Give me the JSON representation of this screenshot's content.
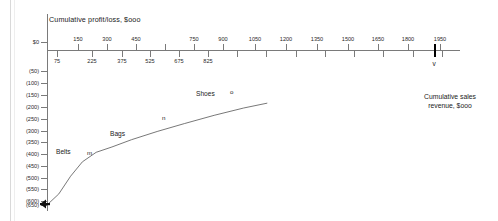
{
  "chart_data": {
    "type": "line",
    "title": "Cumulative profit/loss, $ooo",
    "xlabel": "Cumulative sales revenue, $ooo",
    "ylabel": "Cumulative profit/loss, $ooo",
    "grid": false,
    "legend": "none",
    "xlim": [
      0,
      2100
    ],
    "ylim": [
      -650,
      50
    ],
    "x_ticks_upper": [
      150,
      300,
      450,
      600,
      750,
      900,
      1050,
      1200,
      1350,
      1500,
      1650,
      1800,
      1950
    ],
    "x_ticks_upper_labeled": [
      "150",
      "300",
      "450",
      "",
      "750",
      "900",
      "1050",
      "1200",
      "1350",
      "1500",
      "1650",
      "1800",
      "1950"
    ],
    "x_ticks_lower": [
      75,
      225,
      375,
      525,
      675,
      825,
      975,
      1125,
      1275,
      1425,
      1575,
      1725,
      1875,
      2025
    ],
    "x_ticks_lower_labeled": [
      "75",
      "225",
      "375",
      "525",
      "675",
      "825",
      "",
      "",
      "",
      "",
      "",
      "",
      "",
      ""
    ],
    "y_ticks": [
      0,
      -50,
      -100,
      -150,
      -200,
      -250,
      -300,
      -350,
      -400,
      -450,
      -500,
      -550,
      -600,
      -650
    ],
    "y_tick_labels": [
      "$0",
      "(50)",
      "(100)",
      "(150)",
      "(200)",
      "(250)",
      "(300)",
      "(350)",
      "(400)",
      "(450)",
      "(500)",
      "(550)",
      "(600)",
      "(650)"
    ],
    "series": [
      {
        "name": "cumulative profit/loss curve",
        "points": [
          {
            "x": 0,
            "y": -650
          },
          {
            "x": 60,
            "y": -600
          },
          {
            "x": 120,
            "y": -520
          },
          {
            "x": 180,
            "y": -455
          },
          {
            "x": 250,
            "y": -412
          },
          {
            "x": 330,
            "y": -388
          },
          {
            "x": 430,
            "y": -355
          },
          {
            "x": 560,
            "y": -318
          },
          {
            "x": 700,
            "y": -282
          },
          {
            "x": 850,
            "y": -245
          },
          {
            "x": 1000,
            "y": -212
          },
          {
            "x": 1120,
            "y": -190
          }
        ]
      }
    ],
    "annotations": [
      {
        "label": "Belts",
        "x": 150,
        "y": -410
      },
      {
        "label": "m",
        "x": 330,
        "y": -408
      },
      {
        "label": "Bags",
        "x": 500,
        "y": -330
      },
      {
        "label": "n",
        "x": 790,
        "y": -268
      },
      {
        "label": "Shoes",
        "x": 1000,
        "y": -180
      },
      {
        "label": "o",
        "x": 1150,
        "y": -172
      },
      {
        "label": "v",
        "x": 1950,
        "y": 0
      }
    ]
  },
  "axis": {
    "title": "Cumulative profit/loss, $ooo",
    "side_note_line1": "Cumulative sales",
    "side_note_line2": "revenue, $ooo",
    "x_upper": [
      {
        "label": "150",
        "left": 78
      },
      {
        "label": "300",
        "left": 107
      },
      {
        "label": "450",
        "left": 136
      },
      {
        "label": "",
        "left": 165
      },
      {
        "label": "750",
        "left": 194
      },
      {
        "label": "900",
        "left": 223
      },
      {
        "label": "1050",
        "left": 255
      },
      {
        "label": "1200",
        "left": 286
      },
      {
        "label": "1350",
        "left": 317
      },
      {
        "label": "1500",
        "left": 348
      },
      {
        "label": "1650",
        "left": 378
      },
      {
        "label": "1800",
        "left": 408
      },
      {
        "label": "1950",
        "left": 440
      }
    ],
    "x_lower": [
      {
        "label": "75",
        "left": 57
      },
      {
        "label": "225",
        "left": 92
      },
      {
        "label": "375",
        "left": 122
      },
      {
        "label": "525",
        "left": 150
      },
      {
        "label": "675",
        "left": 179
      },
      {
        "label": "825",
        "left": 208
      },
      {
        "label": "",
        "left": 237
      },
      {
        "label": "",
        "left": 266
      },
      {
        "label": "",
        "left": 296
      },
      {
        "label": "",
        "left": 325
      },
      {
        "label": "",
        "left": 354
      },
      {
        "label": "",
        "left": 383
      },
      {
        "label": "",
        "left": 413
      },
      {
        "label": "",
        "left": 442
      }
    ],
    "y_labels": [
      {
        "label": "$0",
        "top": 42
      },
      {
        "label": "(50)",
        "top": 71
      },
      {
        "label": "(100)",
        "top": 83
      },
      {
        "label": "(150)",
        "top": 95
      },
      {
        "label": "(200)",
        "top": 107
      },
      {
        "label": "(250)",
        "top": 119
      },
      {
        "label": "(300)",
        "top": 131
      },
      {
        "label": "(350)",
        "top": 142
      },
      {
        "label": "(400)",
        "top": 154
      },
      {
        "label": "(450)",
        "top": 166
      },
      {
        "label": "(500)",
        "top": 178
      },
      {
        "label": "(550)",
        "top": 189
      },
      {
        "label": "(600)",
        "top": 201
      },
      {
        "label": "(650)",
        "top": 205
      }
    ],
    "v_marker": "v"
  },
  "curve_labels": {
    "belts": "Belts",
    "m": "m",
    "bags": "Bags",
    "n": "n",
    "shoes": "Shoes",
    "o": "o"
  },
  "colors": {
    "axis": "#7a7a7a",
    "curve": "#555555",
    "text": "#1b1b1b",
    "marker": "#000000"
  }
}
